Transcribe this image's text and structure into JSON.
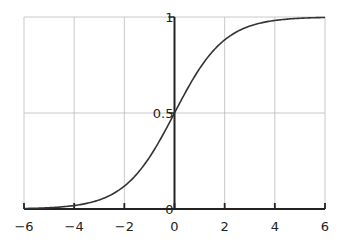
{
  "chart_data": {
    "type": "line",
    "title": "",
    "xlabel": "",
    "ylabel": "",
    "function": "logistic sigmoid 1/(1+e^-x)",
    "xlim": [
      -6,
      6
    ],
    "ylim": [
      0,
      1
    ],
    "grid": true,
    "legend": null,
    "x_ticks": [
      -6,
      -4,
      -2,
      0,
      2,
      4,
      6
    ],
    "x_tick_labels": [
      "−6",
      "−4",
      "−2",
      "0",
      "2",
      "4",
      "6"
    ],
    "y_ticks": [
      0,
      0.5,
      1
    ],
    "y_tick_labels": [
      "0",
      "0.5",
      "1"
    ],
    "series": [
      {
        "name": "sigmoid",
        "color": "#333333",
        "x": [
          -6,
          -5,
          -4,
          -3,
          -2,
          -1,
          0,
          1,
          2,
          3,
          4,
          5,
          6
        ],
        "values": [
          0.0025,
          0.0067,
          0.018,
          0.047,
          0.119,
          0.269,
          0.5,
          0.731,
          0.881,
          0.953,
          0.982,
          0.9933,
          0.9975
        ]
      }
    ]
  },
  "colors": {
    "grid": "#bbbbbb",
    "axis": "#222222",
    "curve": "#333333",
    "background": "#ffffff"
  }
}
